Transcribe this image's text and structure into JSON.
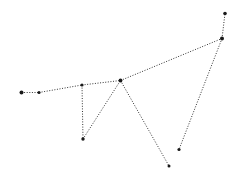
{
  "diagram": {
    "type": "constellation",
    "background": "#ffffff",
    "line_color": "#333333",
    "star_color": "#1a1a1a",
    "stars": [
      {
        "id": "s1",
        "x": 21.5,
        "y": 92.5,
        "r": 2.0
      },
      {
        "id": "s2",
        "x": 39,
        "y": 92.5,
        "r": 1.6
      },
      {
        "id": "s3",
        "x": 82,
        "y": 85,
        "r": 1.6
      },
      {
        "id": "s4",
        "x": 120.5,
        "y": 80.5,
        "r": 1.9
      },
      {
        "id": "s5",
        "x": 222,
        "y": 38.5,
        "r": 2.0
      },
      {
        "id": "s6",
        "x": 225,
        "y": 13.5,
        "r": 1.8
      },
      {
        "id": "s7",
        "x": 83,
        "y": 139,
        "r": 1.7
      },
      {
        "id": "s8",
        "x": 169,
        "y": 166,
        "r": 1.5
      },
      {
        "id": "s9",
        "x": 179,
        "y": 149.5,
        "r": 1.6
      }
    ],
    "edges": [
      [
        "s1",
        "s2"
      ],
      [
        "s2",
        "s3"
      ],
      [
        "s3",
        "s4"
      ],
      [
        "s4",
        "s5"
      ],
      [
        "s5",
        "s6"
      ],
      [
        "s3",
        "s7"
      ],
      [
        "s7",
        "s4"
      ],
      [
        "s4",
        "s8"
      ],
      [
        "s5",
        "s9"
      ]
    ]
  }
}
